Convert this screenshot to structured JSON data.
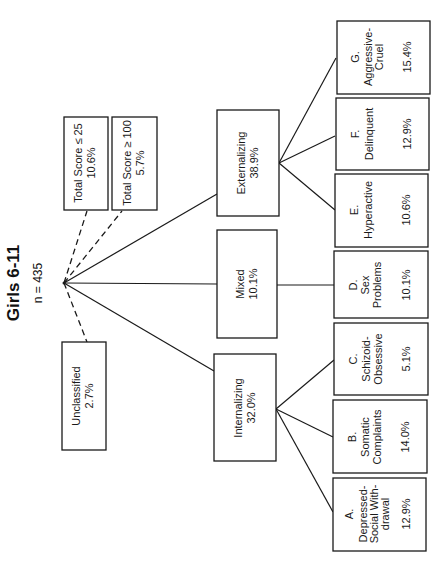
{
  "title": "Girls 6-11",
  "subtitle": "n = 435",
  "root": {
    "label": "root"
  },
  "excluded": [
    {
      "id": "low",
      "label": "Total Score ≤ 25",
      "value": "10.6%"
    },
    {
      "id": "high",
      "label": "Total Score ≥ 100",
      "value": "5.7%"
    },
    {
      "id": "unclassified",
      "label": "Unclassified",
      "value": "2.7%"
    }
  ],
  "groups": [
    {
      "id": "externalizing",
      "label": "Externalizing",
      "value": "38.9%"
    },
    {
      "id": "mixed",
      "label": "Mixed",
      "value": "10.1%"
    },
    {
      "id": "internalizing",
      "label": "Internalizing",
      "value": "32.0%"
    }
  ],
  "syndromes": [
    {
      "id": "G",
      "letter": "G.",
      "lines": [
        "Aggressive-",
        "Cruel"
      ],
      "value": "15.4%",
      "group": "externalizing"
    },
    {
      "id": "F",
      "letter": "F.",
      "lines": [
        "Delinquent"
      ],
      "value": "12.9%",
      "group": "externalizing"
    },
    {
      "id": "E",
      "letter": "E.",
      "lines": [
        "Hyperactive"
      ],
      "value": "10.6%",
      "group": "externalizing"
    },
    {
      "id": "D",
      "letter": "D.",
      "lines": [
        "Sex",
        "Problems"
      ],
      "value": "10.1%",
      "group": "mixed"
    },
    {
      "id": "C",
      "letter": "C.",
      "lines": [
        "Schizoid-",
        "Obsessive"
      ],
      "value": "5.1%",
      "group": "internalizing"
    },
    {
      "id": "B",
      "letter": "B.",
      "lines": [
        "Somatic",
        "Complaints"
      ],
      "value": "14.0%",
      "group": "internalizing"
    },
    {
      "id": "A",
      "letter": "A.",
      "lines": [
        "Depressed-",
        "Social With-",
        "drawal"
      ],
      "value": "12.9%",
      "group": "internalizing"
    }
  ],
  "colors": {
    "ink": "#1a1a1a",
    "background": "#ffffff"
  }
}
